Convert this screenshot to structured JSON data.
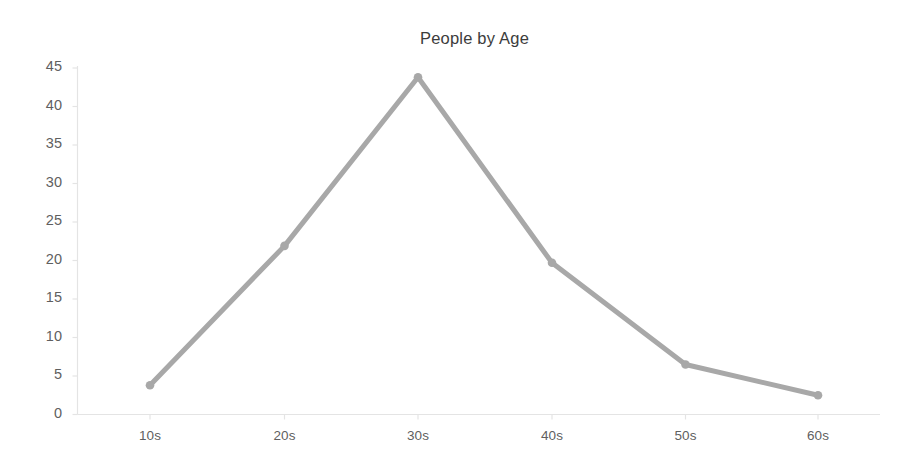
{
  "chart_data": {
    "type": "line",
    "title": "People by Age",
    "xlabel": "",
    "ylabel": "",
    "categories": [
      "10s",
      "20s",
      "30s",
      "40s",
      "50s",
      "60s"
    ],
    "values": [
      3.8,
      21.9,
      43.8,
      19.7,
      6.5,
      2.5
    ],
    "series": [
      {
        "name": "People by Age",
        "values": [
          3.8,
          21.9,
          43.8,
          19.7,
          6.5,
          2.5
        ]
      }
    ],
    "ylim": [
      0,
      45
    ],
    "ytick_labels": [
      "0",
      "5",
      "10",
      "15",
      "20",
      "25",
      "30",
      "35",
      "40",
      "45"
    ],
    "ytick_values": [
      0,
      5,
      10,
      15,
      20,
      25,
      30,
      35,
      40,
      45
    ],
    "grid": false,
    "legend": "none",
    "line_color": "#a8a8a8",
    "marker_color": "#a8a8a8",
    "axis_color": "#e4e4e4",
    "title_color": "#3c3c3c",
    "tick_label_color": "#5f5f5f",
    "background_color": "#ffffff"
  }
}
